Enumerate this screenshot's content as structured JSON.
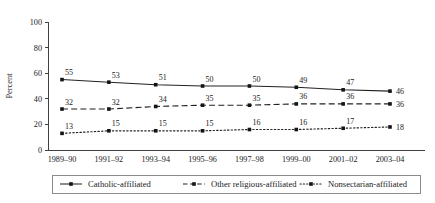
{
  "chart_data": {
    "type": "line",
    "title": "",
    "xlabel": "",
    "ylabel": "Percent",
    "ylim": [
      0,
      100
    ],
    "yticks": [
      0,
      20,
      40,
      60,
      80,
      100
    ],
    "grid": false,
    "legend_position": "bottom",
    "show_point_labels": true,
    "categories": [
      "1989–90",
      "1991–92",
      "1993–94",
      "1995–96",
      "1997–98",
      "1999–00",
      "2001–02",
      "2003–04"
    ],
    "series": [
      {
        "name": "Catholic-affiliated",
        "style": "solid",
        "marker": "square",
        "color": "#222222",
        "values": [
          55,
          53,
          51,
          50,
          50,
          49,
          47,
          46
        ]
      },
      {
        "name": "Other religious-affiliated",
        "style": "dashed",
        "marker": "square",
        "color": "#222222",
        "values": [
          32,
          32,
          34,
          35,
          35,
          36,
          36,
          36
        ]
      },
      {
        "name": "Nonsectarian-affiliated",
        "style": "dotted",
        "marker": "square",
        "color": "#222222",
        "values": [
          13,
          15,
          15,
          15,
          16,
          16,
          17,
          18
        ]
      }
    ]
  }
}
